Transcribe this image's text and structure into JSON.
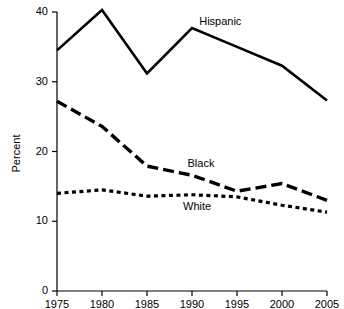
{
  "chart_data": {
    "type": "line",
    "title": "",
    "subtitle": "",
    "xlabel": "",
    "ylabel": "Percent",
    "x": [
      1975,
      1980,
      1985,
      1990,
      1995,
      2000,
      2005
    ],
    "xtick_labels": [
      "1975",
      "1980",
      "1985",
      "1990",
      "1995",
      "2000",
      "2005"
    ],
    "ytick_labels": [
      "0",
      "10",
      "20",
      "30",
      "40"
    ],
    "yticks": [
      0,
      10,
      20,
      30,
      40
    ],
    "xlim": [
      1975,
      2005
    ],
    "ylim": [
      0,
      40
    ],
    "grid": false,
    "legend_position": "inline-annotations",
    "series": [
      {
        "name": "Hispanic",
        "line_style": "solid",
        "color": "#000000",
        "values": [
          34.5,
          40.3,
          31.2,
          37.7,
          35.0,
          32.3,
          27.3
        ],
        "label_text": "Hispanic"
      },
      {
        "name": "Black",
        "line_style": "dashed",
        "color": "#000000",
        "values": [
          27.2,
          23.6,
          17.9,
          16.6,
          14.3,
          15.4,
          13.0
        ],
        "label_text": "Black"
      },
      {
        "name": "White",
        "line_style": "dotted",
        "color": "#000000",
        "values": [
          14.0,
          14.5,
          13.6,
          13.8,
          13.5,
          12.3,
          11.3
        ],
        "label_text": "White"
      }
    ],
    "annotations": [
      {
        "text": "Hispanic",
        "x": 1990.8,
        "y": 38.5
      },
      {
        "text": "Black",
        "x": 1989.5,
        "y": 18.2
      },
      {
        "text": "White",
        "x": 1989.0,
        "y": 12.0
      }
    ]
  }
}
